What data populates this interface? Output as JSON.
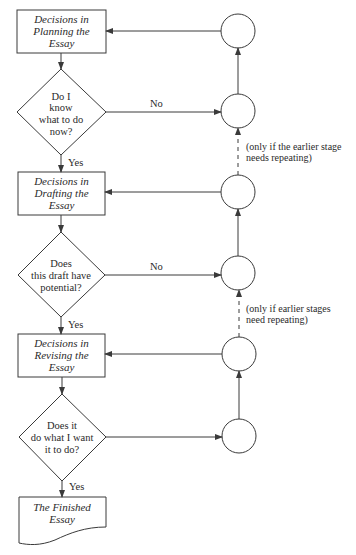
{
  "diagram": {
    "type": "flowchart",
    "colors": {
      "line": "#3a3a3a",
      "text": "#2a2a2a",
      "background": "#ffffff"
    },
    "boxes": [
      {
        "id": "planning",
        "lines": [
          "Decisions in",
          "Planning the",
          "Essay"
        ]
      },
      {
        "id": "drafting",
        "lines": [
          "Decisions in",
          "Drafting the",
          "Essay"
        ]
      },
      {
        "id": "revising",
        "lines": [
          "Decisions in",
          "Revising the",
          "Essay"
        ]
      }
    ],
    "decisions": [
      {
        "id": "know",
        "lines": [
          "Do I",
          "know",
          "what to do",
          "now?"
        ],
        "yes_label": "Yes",
        "no_label": "No"
      },
      {
        "id": "potential",
        "lines": [
          "Does",
          "this draft have",
          "potential?"
        ],
        "yes_label": "Yes",
        "no_label": "No"
      },
      {
        "id": "does-it",
        "lines": [
          "Does it",
          "do what I want",
          "it to do?"
        ],
        "yes_label": "Yes"
      }
    ],
    "end": {
      "id": "finished",
      "lines": [
        "The Finished",
        "Essay"
      ]
    },
    "notes": [
      {
        "lines": [
          "(only if the earlier stage",
          "needs repeating)"
        ]
      },
      {
        "lines": [
          "(only if earlier stages",
          "need repeating)"
        ]
      }
    ],
    "connector_circles": 6
  }
}
